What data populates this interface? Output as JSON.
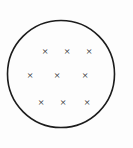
{
  "figure": {
    "name": "circle-with-x-marks",
    "canvas": {
      "width": 133,
      "height": 148
    },
    "background_color": "#fdfdfd",
    "stroke_color": "#1c1c1c",
    "mark_color": "#232323"
  },
  "boundary": {
    "shape": "circle",
    "label": "circle-outline",
    "center_x": 61,
    "center_y": 74,
    "radius": 53.5,
    "stroke_width": 1.6,
    "stroke_color": "#1c1c1c",
    "fill": "none"
  },
  "marks": {
    "glyph": "×",
    "count": 9,
    "rows": 3,
    "columns": 3,
    "font_size": 11,
    "color": "#232323",
    "items": [
      {
        "id": "x-1",
        "row": 1,
        "col": 1,
        "x": 45,
        "y": 51
      },
      {
        "id": "x-2",
        "row": 1,
        "col": 2,
        "x": 67,
        "y": 51
      },
      {
        "id": "x-3",
        "row": 1,
        "col": 3,
        "x": 89,
        "y": 51
      },
      {
        "id": "x-4",
        "row": 2,
        "col": 1,
        "x": 30,
        "y": 75
      },
      {
        "id": "x-5",
        "row": 2,
        "col": 2,
        "x": 57,
        "y": 75
      },
      {
        "id": "x-6",
        "row": 2,
        "col": 3,
        "x": 85,
        "y": 75
      },
      {
        "id": "x-7",
        "row": 3,
        "col": 1,
        "x": 41,
        "y": 102
      },
      {
        "id": "x-8",
        "row": 3,
        "col": 2,
        "x": 63,
        "y": 102
      },
      {
        "id": "x-9",
        "row": 3,
        "col": 3,
        "x": 87,
        "y": 102
      }
    ]
  }
}
